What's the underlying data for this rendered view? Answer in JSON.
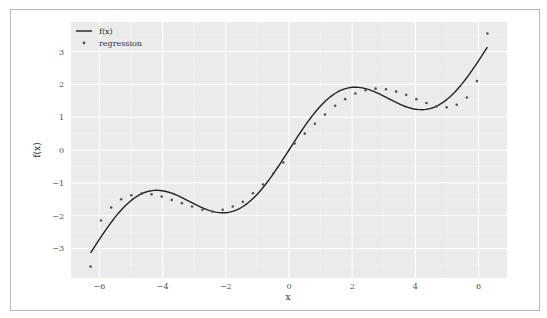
{
  "chart_data": {
    "type": "line",
    "title": "",
    "xlabel": "x",
    "ylabel": "f(x)",
    "xlim": [
      -6.9,
      6.9
    ],
    "ylim": [
      -3.9,
      3.9
    ],
    "grid": true,
    "legend_position": "upper left",
    "x_ticks": [
      -6,
      -4,
      -2,
      0,
      2,
      4,
      6
    ],
    "x_tick_labels": [
      "−6",
      "−4",
      "−2",
      "0",
      "2",
      "4",
      "6"
    ],
    "y_ticks": [
      3,
      2,
      1,
      0,
      -1,
      -2,
      -3
    ],
    "y_tick_labels": [
      "3",
      "2",
      "1",
      "0",
      "−1",
      "−2",
      "−3"
    ],
    "series": [
      {
        "name": "f(x)",
        "style": "line",
        "color": "#222222",
        "formula": "x/2 + sin(x)",
        "x": [
          -6.28,
          -5.9,
          -5.5,
          -5.0,
          -4.5,
          -4.19,
          -3.8,
          -3.4,
          -3.0,
          -2.6,
          -2.09,
          -1.6,
          -1.2,
          -0.8,
          -0.4,
          0,
          0.4,
          0.8,
          1.2,
          1.6,
          2.09,
          2.6,
          3.0,
          3.4,
          3.8,
          4.19,
          4.5,
          5.0,
          5.5,
          5.9,
          6.28
        ],
        "values": [
          -3.14,
          -2.58,
          -2.04,
          -1.54,
          -1.27,
          -1.23,
          -1.29,
          -1.44,
          -1.64,
          -1.82,
          -1.91,
          -1.8,
          -1.53,
          -1.12,
          -0.59,
          0,
          0.59,
          1.12,
          1.53,
          1.8,
          1.91,
          1.82,
          1.64,
          1.44,
          1.29,
          1.23,
          1.27,
          1.54,
          2.04,
          2.58,
          3.14
        ]
      },
      {
        "name": "regression",
        "style": "scatter",
        "color": "#555555",
        "x": [
          -6.28,
          -5.95,
          -5.63,
          -5.31,
          -4.99,
          -4.67,
          -4.35,
          -4.03,
          -3.71,
          -3.39,
          -3.07,
          -2.74,
          -2.42,
          -2.1,
          -1.78,
          -1.46,
          -1.14,
          -0.82,
          -0.5,
          -0.18,
          0.18,
          0.5,
          0.82,
          1.14,
          1.46,
          1.78,
          2.1,
          2.42,
          2.74,
          3.07,
          3.39,
          3.71,
          4.03,
          4.35,
          4.67,
          4.99,
          5.31,
          5.63,
          5.95,
          6.28
        ],
        "values": [
          -3.55,
          -2.15,
          -1.75,
          -1.5,
          -1.38,
          -1.33,
          -1.35,
          -1.42,
          -1.52,
          -1.62,
          -1.72,
          -1.82,
          -1.88,
          -1.82,
          -1.72,
          -1.58,
          -1.32,
          -1.05,
          -0.72,
          -0.38,
          0.2,
          0.5,
          0.8,
          1.08,
          1.35,
          1.55,
          1.72,
          1.82,
          1.87,
          1.85,
          1.78,
          1.68,
          1.55,
          1.43,
          1.33,
          1.3,
          1.38,
          1.6,
          2.1,
          3.55
        ]
      }
    ]
  },
  "legend": {
    "items": [
      {
        "label": "f(x)",
        "marker": "line"
      },
      {
        "label": "regression",
        "marker": "dot"
      }
    ]
  },
  "axes": {
    "xlabel": "x",
    "ylabel": "f(x)"
  },
  "colors": {
    "plot_bg": "#ebebeb",
    "grid": "#ffffff",
    "line": "#222222",
    "dots": "#555555"
  }
}
